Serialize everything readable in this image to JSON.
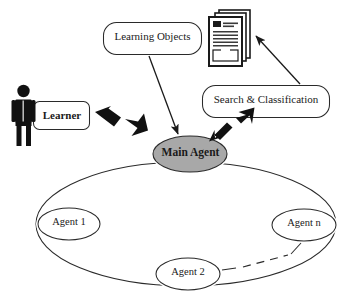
{
  "figure": {
    "type": "diagram",
    "subtype": "multi-agent architecture",
    "background_color": "#ffffff",
    "stroke_color": "#1a1a1a",
    "fill_gray": "#a8a8a8",
    "fill_black": "#111111"
  },
  "nodes": {
    "learning_objects": {
      "label": "Learning Objects",
      "shape": "rounded-rectangle",
      "x": 103,
      "y": 22,
      "w": 99,
      "h": 33
    },
    "search_classification": {
      "label": "Search & Classification",
      "shape": "rounded-rectangle",
      "x": 202,
      "y": 85,
      "w": 128,
      "h": 33
    },
    "learner_box": {
      "label": "Learner",
      "shape": "rounded-rectangle",
      "x": 33,
      "y": 101,
      "w": 57,
      "h": 29
    },
    "main_agent": {
      "label": "Main Agent",
      "shape": "ellipse",
      "fill": "#a8a8a8",
      "cx": 190,
      "cy": 154,
      "rx": 37,
      "ry": 18
    },
    "agent_1": {
      "label": "Agent 1",
      "shape": "ellipse",
      "fill": "#ffffff",
      "cx": 69,
      "cy": 224,
      "rx": 31,
      "ry": 16
    },
    "agent_2": {
      "label": "Agent 2",
      "shape": "ellipse",
      "fill": "#ffffff",
      "cx": 188,
      "cy": 274,
      "rx": 32,
      "ry": 16
    },
    "agent_n": {
      "label": "Agent n",
      "shape": "ellipse",
      "fill": "#ffffff",
      "cx": 304,
      "cy": 225,
      "rx": 32,
      "ry": 16
    }
  },
  "icons": {
    "documents": {
      "name": "documents-stack-icon",
      "description": "stack of three text documents",
      "x": 208,
      "y": 10,
      "w": 42,
      "h": 58
    },
    "learner_person": {
      "name": "person-icon",
      "description": "filled black standing stick figure",
      "x": 14,
      "y": 84,
      "w": 30,
      "h": 62
    }
  },
  "connectors": [
    {
      "name": "learner-main-agent",
      "style": "thick-double-arrow",
      "from": "learner_box",
      "to": "main_agent"
    },
    {
      "name": "learning-objects-main-agent",
      "style": "thin-arrow",
      "from": "learning_objects",
      "to": "main_agent"
    },
    {
      "name": "search-classification-documents",
      "style": "thin-arrow",
      "from": "search_classification",
      "to": "documents"
    },
    {
      "name": "main-agent-search-classification",
      "style": "thick-double-arrow",
      "from": "main_agent",
      "to": "search_classification"
    },
    {
      "name": "agent-ring",
      "style": "solid-ellipse-ring",
      "description": "large ellipse ring linking Main Agent, Agent 1, Agent 2 and Agent n"
    },
    {
      "name": "agent2-agentn-dashed",
      "style": "dashed-line",
      "from": "agent_2",
      "to": "agent_n"
    }
  ]
}
